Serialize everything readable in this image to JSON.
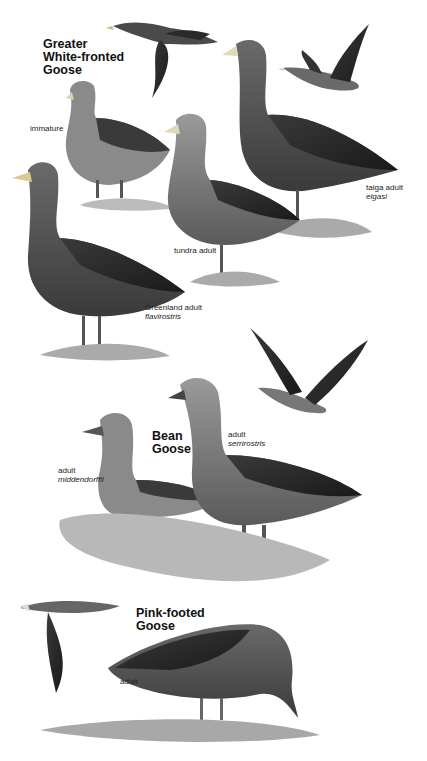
{
  "plate": {
    "background": "#ffffff",
    "sections": [
      {
        "title_line1": "Greater",
        "title_line2": "White-fronted",
        "title_line3": "Goose",
        "labels": [
          {
            "common": "immature",
            "scientific": ""
          },
          {
            "common": "tundra adult",
            "scientific": ""
          },
          {
            "common": "taiga adult",
            "scientific": "elgasi"
          },
          {
            "common": "Greenland adult",
            "scientific": "flavirostris"
          }
        ]
      },
      {
        "title_line1": "Bean",
        "title_line2": "Goose",
        "labels": [
          {
            "common": "adult",
            "scientific": "middendorffii"
          },
          {
            "common": "adult",
            "scientific": "serrirostris"
          }
        ]
      },
      {
        "title_line1": "Pink-footed",
        "title_line2": "Goose",
        "labels": [
          {
            "common": "adult",
            "scientific": ""
          }
        ]
      }
    ]
  }
}
